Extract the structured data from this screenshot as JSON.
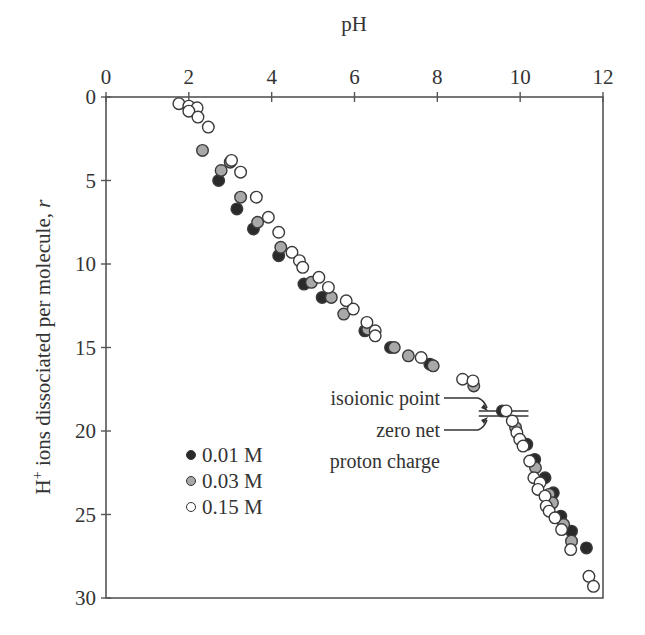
{
  "chart_data": {
    "type": "scatter",
    "title": "",
    "xlabel": "pH",
    "ylabel": "H+ ions dissociated per molecule, r",
    "ylabel_parts": {
      "main": "H",
      "sup": "+",
      "rest": " ions dissociated per molecule, ",
      "var": "r"
    },
    "x_axis_position": "top",
    "y_axis_inverted": true,
    "xlim": [
      0,
      12
    ],
    "ylim": [
      0,
      30
    ],
    "x_ticks": [
      0,
      2,
      4,
      6,
      8,
      10,
      12
    ],
    "y_ticks": [
      0,
      5,
      10,
      15,
      20,
      25,
      30
    ],
    "grid": false,
    "legend_position": "lower-left inside",
    "series": [
      {
        "name": "0.01 M",
        "marker": "filled-circle",
        "color": "#2a2a2a",
        "points": [
          [
            2.72,
            5.0
          ],
          [
            3.16,
            6.7
          ],
          [
            3.56,
            7.9
          ],
          [
            4.17,
            9.5
          ],
          [
            4.78,
            11.2
          ],
          [
            5.22,
            12.0
          ],
          [
            6.25,
            14.0
          ],
          [
            6.87,
            15.0
          ],
          [
            7.82,
            16.0
          ],
          [
            9.57,
            18.8
          ],
          [
            10.16,
            20.8
          ],
          [
            10.35,
            21.7
          ],
          [
            10.6,
            22.8
          ],
          [
            10.8,
            23.7
          ],
          [
            10.98,
            25.1
          ],
          [
            11.24,
            26.0
          ],
          [
            11.6,
            27.0
          ]
        ]
      },
      {
        "name": "0.03 M",
        "marker": "gray-circle",
        "color": "#a8a8a8",
        "points": [
          [
            2.33,
            3.2
          ],
          [
            3.0,
            3.9
          ],
          [
            2.78,
            4.4
          ],
          [
            3.25,
            6.0
          ],
          [
            3.66,
            7.5
          ],
          [
            4.22,
            9.0
          ],
          [
            4.96,
            11.1
          ],
          [
            5.44,
            12.0
          ],
          [
            5.74,
            13.0
          ],
          [
            6.32,
            13.9
          ],
          [
            6.96,
            15.0
          ],
          [
            7.3,
            15.5
          ],
          [
            7.9,
            16.1
          ],
          [
            8.88,
            17.3
          ],
          [
            9.89,
            19.8
          ],
          [
            10.37,
            22.2
          ],
          [
            10.7,
            23.8
          ],
          [
            10.78,
            24.3
          ],
          [
            11.05,
            25.6
          ],
          [
            11.24,
            26.6
          ]
        ]
      },
      {
        "name": "0.15 M",
        "marker": "open-circle",
        "color": "#ffffff",
        "points": [
          [
            1.76,
            0.4
          ],
          [
            2.0,
            0.55
          ],
          [
            2.2,
            0.65
          ],
          [
            2.0,
            0.85
          ],
          [
            2.22,
            1.2
          ],
          [
            2.47,
            1.8
          ],
          [
            3.03,
            3.8
          ],
          [
            3.25,
            4.5
          ],
          [
            3.63,
            6.0
          ],
          [
            3.92,
            7.2
          ],
          [
            4.17,
            8.1
          ],
          [
            4.49,
            9.3
          ],
          [
            4.67,
            9.8
          ],
          [
            4.75,
            10.2
          ],
          [
            5.14,
            10.8
          ],
          [
            5.37,
            11.4
          ],
          [
            5.8,
            12.2
          ],
          [
            5.97,
            12.7
          ],
          [
            6.3,
            13.5
          ],
          [
            6.5,
            14.0
          ],
          [
            6.5,
            14.3
          ],
          [
            7.61,
            15.6
          ],
          [
            8.61,
            16.9
          ],
          [
            8.86,
            17.0
          ],
          [
            9.66,
            18.8
          ],
          [
            9.81,
            19.4
          ],
          [
            9.92,
            20.1
          ],
          [
            9.99,
            20.5
          ],
          [
            10.07,
            20.9
          ],
          [
            10.23,
            21.8
          ],
          [
            10.33,
            22.8
          ],
          [
            10.48,
            23.1
          ],
          [
            10.43,
            23.5
          ],
          [
            10.6,
            23.9
          ],
          [
            10.63,
            24.5
          ],
          [
            10.7,
            24.8
          ],
          [
            10.84,
            25.2
          ],
          [
            11.0,
            25.9
          ],
          [
            11.22,
            27.1
          ],
          [
            11.66,
            28.7
          ],
          [
            11.77,
            29.3
          ]
        ]
      }
    ],
    "annotations": [
      {
        "text": "isoionic point",
        "target": [
          9.1,
          18.8
        ]
      },
      {
        "text": "zero net",
        "text2": "proton charge",
        "target": [
          9.1,
          19.1
        ]
      }
    ],
    "reference_lines": [
      {
        "r": 18.8,
        "x_from": 9.0,
        "x_to": 10.2
      },
      {
        "r": 19.1,
        "x_from": 9.0,
        "x_to": 10.2
      }
    ]
  },
  "legend": {
    "items": [
      {
        "label": "0.01 M",
        "color": "#2a2a2a"
      },
      {
        "label": "0.03 M",
        "color": "#a8a8a8"
      },
      {
        "label": "0.15 M",
        "color": "#ffffff"
      }
    ]
  },
  "annotations": {
    "isoionic": "isoionic point",
    "zero_net_line1": "zero net",
    "zero_net_line2": "proton charge"
  },
  "axes": {
    "x_title": "pH",
    "y_title_main": "H",
    "y_title_sup": "+",
    "y_title_rest": " ions dissociated per molecule, ",
    "y_title_var": "r"
  }
}
